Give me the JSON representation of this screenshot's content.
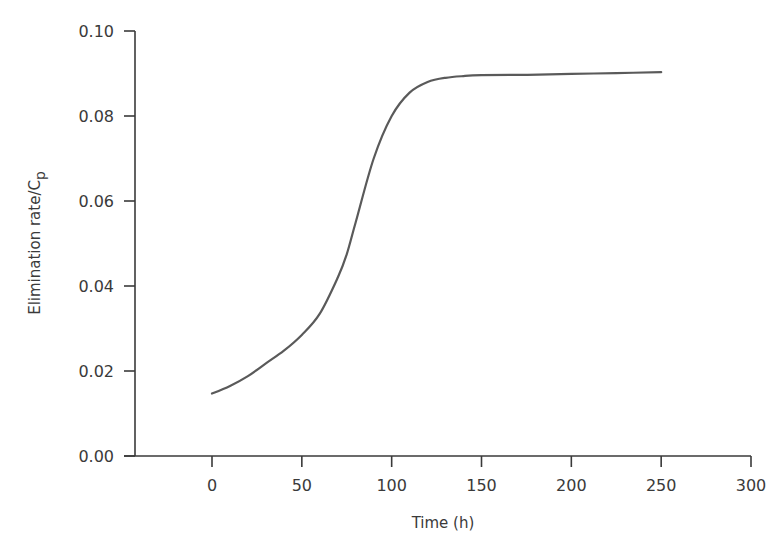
{
  "chart_data": {
    "type": "line",
    "title": "",
    "xlabel": "Time (h)",
    "ylabel": "Elimination rate/C",
    "ylabel_subscript": "p",
    "xlim": [
      -50,
      300
    ],
    "ylim": [
      0,
      0.1
    ],
    "x_ticks": [
      0,
      50,
      100,
      150,
      200,
      250,
      300
    ],
    "x_tick_labels": [
      "0",
      "50",
      "100",
      "150",
      "200",
      "250",
      "300"
    ],
    "y_ticks": [
      0.0,
      0.02,
      0.04,
      0.06,
      0.08,
      0.1
    ],
    "y_tick_labels": [
      "0.00",
      "0.02",
      "0.04",
      "0.06",
      "0.08",
      "0.10"
    ],
    "grid": false,
    "legend": null,
    "series": [
      {
        "name": "Elimination rate/Cp",
        "color": "#5a5a5a",
        "x": [
          0,
          10,
          20,
          30,
          40,
          50,
          60,
          70,
          75,
          80,
          90,
          100,
          110,
          120,
          130,
          140,
          150,
          175,
          200,
          225,
          250
        ],
        "values": [
          0.0147,
          0.0165,
          0.0188,
          0.0218,
          0.0248,
          0.0285,
          0.0335,
          0.042,
          0.0475,
          0.055,
          0.07,
          0.08,
          0.0855,
          0.088,
          0.089,
          0.0894,
          0.0896,
          0.0897,
          0.0899,
          0.0901,
          0.0903
        ]
      }
    ]
  },
  "axes": {
    "x_title": "Time (h)",
    "y_title_main": "Elimination rate/C",
    "y_title_sub": "p"
  }
}
